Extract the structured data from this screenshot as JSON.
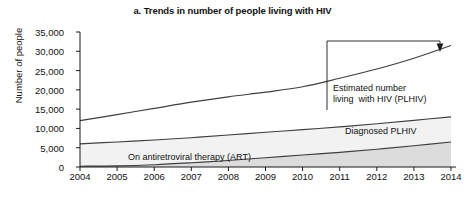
{
  "chart_data": {
    "type": "area",
    "title": "a. Trends in number of people living with HIV",
    "xlabel": "",
    "ylabel": "Number of people",
    "x": [
      2004,
      2005,
      2006,
      2007,
      2008,
      2009,
      2010,
      2011,
      2012,
      2013,
      2014
    ],
    "xtick_labels": [
      "2004",
      "2005",
      "2006",
      "2007",
      "2008",
      "2009",
      "2010",
      "2011",
      "2012",
      "2013",
      "2014"
    ],
    "ytick_labels": [
      "0",
      "5,000",
      "10,000",
      "15,000",
      "20,000",
      "25,000",
      "30,000",
      "35,000"
    ],
    "ytick_values": [
      0,
      5000,
      10000,
      15000,
      20000,
      25000,
      30000,
      35000
    ],
    "ylim": [
      0,
      35000
    ],
    "xlim": [
      2004,
      2014
    ],
    "grid": false,
    "legend_position": "inline-annotations",
    "series": [
      {
        "name": "Estimated number living  with HIV (PLHIV)",
        "values": [
          12000,
          13600,
          15200,
          16800,
          18200,
          19400,
          20800,
          23000,
          25400,
          28200,
          31500
        ]
      },
      {
        "name": "Diagnosed PLHIV",
        "values": [
          6000,
          6500,
          7000,
          7600,
          8300,
          9000,
          9700,
          10400,
          11200,
          12100,
          13000
        ]
      },
      {
        "name": "On antiretroviral therapy (ART)",
        "values": [
          200,
          300,
          600,
          1100,
          1700,
          2400,
          3100,
          3800,
          4600,
          5500,
          6500
        ]
      }
    ],
    "annotations": [
      {
        "id": "plhiv",
        "text": "Estimated number\nliving  with HIV (PLHIV)",
        "points_to_series": "Estimated number living  with HIV (PLHIV)",
        "points_to_x": 2014
      },
      {
        "id": "diagnosed",
        "text": "Diagnosed PLHIV",
        "points_to_series": "Diagnosed PLHIV"
      },
      {
        "id": "art",
        "text": "On antiretroviral therapy (ART)",
        "points_to_series": "On antiretroviral therapy (ART)"
      }
    ],
    "colors": {
      "line": "#3f3f3f",
      "band_lower_fill": "#dcdcdc",
      "band_middle_fill": "#f2f2f2",
      "background": "#ffffff",
      "axis": "#1a1a1a"
    }
  }
}
